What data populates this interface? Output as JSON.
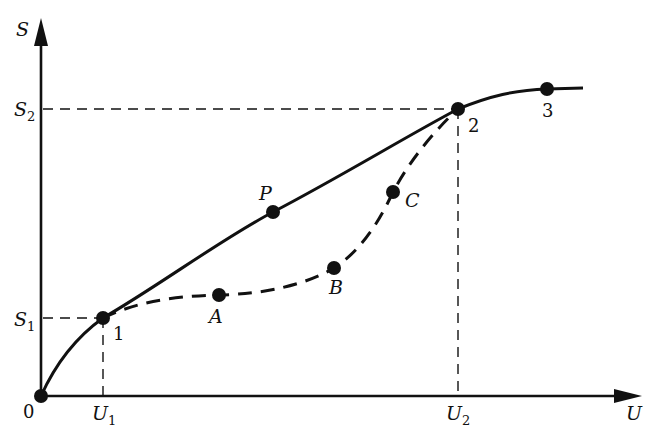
{
  "diagram": {
    "axes": {
      "y_label": "S",
      "x_label": "U",
      "origin_label": "0",
      "y_ticks": [
        {
          "main": "S",
          "sub": "1"
        },
        {
          "main": "S",
          "sub": "2"
        }
      ],
      "x_ticks": [
        {
          "main": "U",
          "sub": "1"
        },
        {
          "main": "U",
          "sub": "2"
        }
      ]
    },
    "points": {
      "origin": {
        "label": ""
      },
      "p1": {
        "label": "1"
      },
      "p2": {
        "label": "2"
      },
      "p3": {
        "label": "3"
      },
      "P": {
        "label": "P"
      },
      "A": {
        "label": "A"
      },
      "B": {
        "label": "B"
      },
      "C": {
        "label": "C"
      }
    },
    "curves": [
      {
        "name": "equilibrium curve",
        "style": "solid",
        "through": [
          "0",
          "1",
          "P",
          "2",
          "3"
        ]
      },
      {
        "name": "non-equilibrium path",
        "style": "dashed",
        "through": [
          "1",
          "A",
          "B",
          "C",
          "2"
        ]
      }
    ],
    "colors": {
      "ink": "#111111",
      "background": "#ffffff"
    }
  }
}
